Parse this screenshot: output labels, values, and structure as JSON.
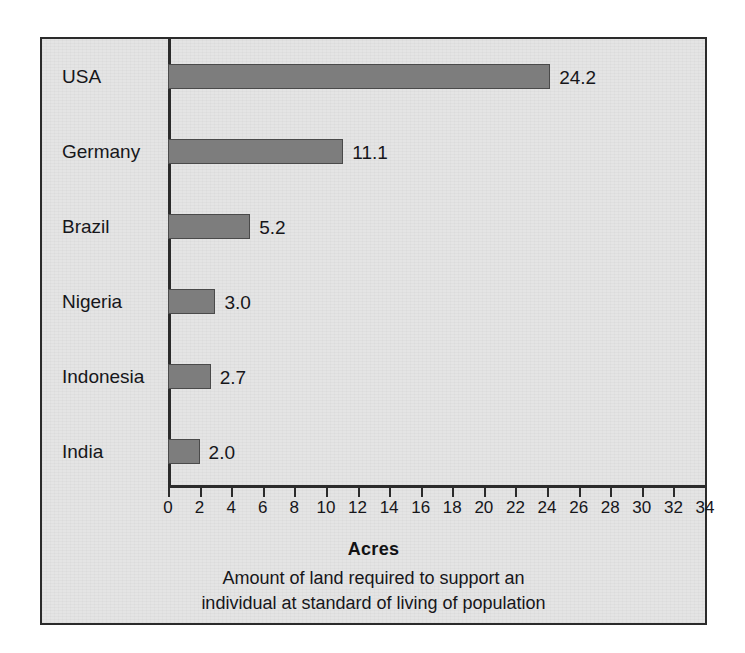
{
  "chart_data": {
    "type": "bar",
    "orientation": "horizontal",
    "title": "",
    "categories": [
      "USA",
      "Germany",
      "Brazil",
      "Nigeria",
      "Indonesia",
      "India"
    ],
    "values": [
      24.2,
      11.1,
      5.2,
      3.0,
      2.7,
      2.0
    ],
    "value_labels": [
      "24.2",
      "11.1",
      "5.2",
      "3.0",
      "2.7",
      "2.0"
    ],
    "xlabel": "Acres",
    "ylabel": "",
    "xlim": [
      0,
      34
    ],
    "xticks": [
      0,
      2,
      4,
      6,
      8,
      10,
      12,
      14,
      16,
      18,
      20,
      22,
      24,
      26,
      28,
      30,
      32,
      34
    ],
    "xtick_labels": [
      "0",
      "2",
      "4",
      "6",
      "8",
      "10",
      "12",
      "14",
      "16",
      "18",
      "20",
      "22",
      "24",
      "26",
      "28",
      "30",
      "32",
      "34"
    ],
    "grid": false,
    "legend": false,
    "caption_lines": [
      "Amount of land required to support an",
      "individual at standard of living of population"
    ],
    "colors": {
      "bar_fill": "#7d7d7d",
      "bar_border": "#4a4a4a",
      "plot_background": "#e4e4e4",
      "frame_border": "#2b2b2b",
      "text": "#16161a"
    }
  }
}
